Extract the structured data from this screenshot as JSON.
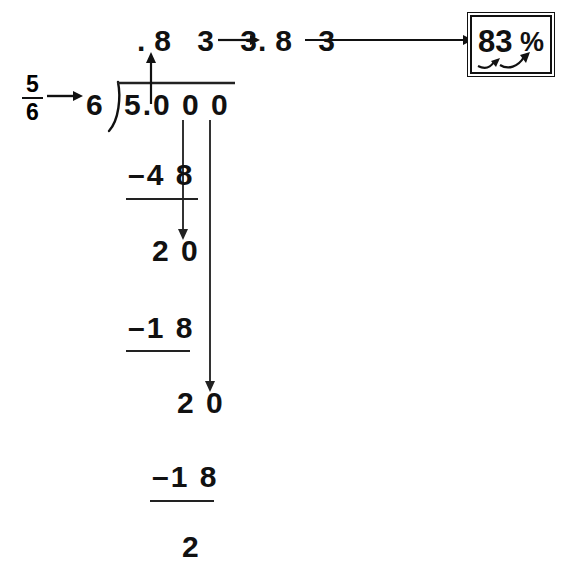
{
  "figure": {
    "ink_color": "#111111",
    "background_color": "#ffffff"
  },
  "fraction": {
    "numerator": "5",
    "denominator": "6"
  },
  "division": {
    "divisor": "6",
    "dividend": "5.0 0 0",
    "quotient": ".8 3 3"
  },
  "steps": [
    {
      "subtrahend": "–4 8",
      "remainder": "2 0"
    },
    {
      "subtrahend": "–1 8",
      "remainder": "2 0"
    },
    {
      "subtrahend": "–1 8",
      "remainder": "2"
    }
  ],
  "rounding": {
    "rounded_decimal": ".8 3"
  },
  "answer": {
    "value": "83",
    "unit": "%",
    "full": "83%"
  },
  "arrows": {
    "fraction_to_divisor": "arrow-right",
    "quotient_up": "arrow-up",
    "quotient_to_rounded": "arrow-right",
    "rounded_to_answer": "arrow-right-long",
    "bring_down_1": "arrow-down",
    "bring_down_2": "arrow-down",
    "decimal_shift": "curved-arrow-right"
  }
}
